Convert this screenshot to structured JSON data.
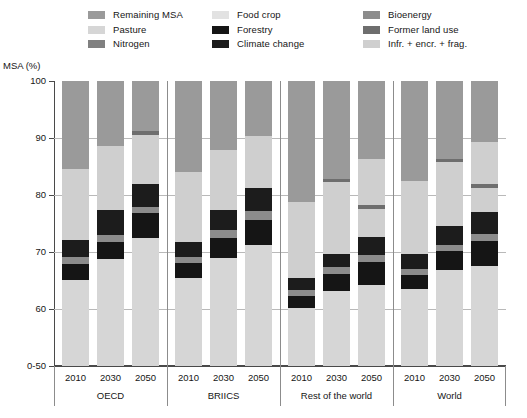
{
  "legend": {
    "columns": [
      [
        {
          "label": "Remaining MSA",
          "key": "remaining_msa",
          "color": "#9a9a9a"
        },
        {
          "label": "Pasture",
          "key": "pasture",
          "color": "#d6d6d6"
        },
        {
          "label": "Nitrogen",
          "key": "nitrogen",
          "color": "#808080"
        }
      ],
      [
        {
          "label": "Food crop",
          "key": "food_crop",
          "color": "#e2e2e2"
        },
        {
          "label": "Forestry",
          "key": "forestry",
          "color": "#151515"
        },
        {
          "label": "Climate change",
          "key": "climate_change",
          "color": "#1c1c1c"
        }
      ],
      [
        {
          "label": "Bioenergy",
          "key": "bioenergy",
          "color": "#8c8c8c"
        },
        {
          "label": "Former land use",
          "key": "former_land_use",
          "color": "#6e6e6e"
        },
        {
          "label": "Infr. + encr. + frag.",
          "key": "infr_encr_frag",
          "color": "#cfcfcf"
        }
      ]
    ]
  },
  "axis": {
    "y_title": "MSA (%)",
    "y_ticks": [
      "100",
      "90",
      "80",
      "70",
      "60",
      "0-50"
    ],
    "y_values": [
      100,
      90,
      80,
      70,
      60,
      50
    ],
    "y_min": 50,
    "y_max": 100
  },
  "chart_data": {
    "type": "bar",
    "title": "",
    "subtitle": "",
    "xlabel": "",
    "ylabel": "MSA (%)",
    "ylim": [
      50,
      100
    ],
    "ytick_labels": [
      "0-50",
      "60",
      "70",
      "80",
      "90",
      "100"
    ],
    "stacked": true,
    "grid": true,
    "legend_position": "top",
    "categories": [
      "OECD",
      "BRIICS",
      "Rest of the world",
      "World"
    ],
    "subcategories": [
      "2010",
      "2030",
      "2050"
    ],
    "series_order": [
      "remaining_msa",
      "former_land_use",
      "infr_encr_frag",
      "nitrogen",
      "climate_change",
      "bioenergy",
      "forestry",
      "food_crop",
      "pasture"
    ],
    "series_colors": {
      "remaining_msa": "#9a9a9a",
      "pasture": "#d6d6d6",
      "nitrogen": "#808080",
      "food_crop": "#e2e2e2",
      "forestry": "#151515",
      "climate_change": "#1c1c1c",
      "bioenergy": "#8c8c8c",
      "former_land_use": "#6e6e6e",
      "infr_encr_frag": "#cfcfcf"
    },
    "groups": [
      {
        "name": "OECD",
        "bars": [
          {
            "year": "2010",
            "segments": [
              {
                "key": "remaining_msa",
                "value": 15.5
              },
              {
                "key": "infr_encr_frag",
                "value": 12.4
              },
              {
                "key": "climate_change",
                "value": 3.0
              },
              {
                "key": "bioenergy",
                "value": 1.2
              },
              {
                "key": "forestry",
                "value": 2.8
              },
              {
                "key": "pasture",
                "value": 15.1
              }
            ]
          },
          {
            "year": "2030",
            "segments": [
              {
                "key": "remaining_msa",
                "value": 11.4
              },
              {
                "key": "infr_encr_frag",
                "value": 11.2
              },
              {
                "key": "climate_change",
                "value": 4.4
              },
              {
                "key": "bioenergy",
                "value": 1.2
              },
              {
                "key": "forestry",
                "value": 3.0
              },
              {
                "key": "pasture",
                "value": 18.8
              }
            ]
          },
          {
            "year": "2050",
            "segments": [
              {
                "key": "remaining_msa",
                "value": 8.8
              },
              {
                "key": "former_land_use",
                "value": 0.7
              },
              {
                "key": "infr_encr_frag",
                "value": 8.6
              },
              {
                "key": "climate_change",
                "value": 4.0
              },
              {
                "key": "bioenergy",
                "value": 1.1
              },
              {
                "key": "forestry",
                "value": 4.4
              },
              {
                "key": "pasture",
                "value": 22.4
              }
            ]
          }
        ]
      },
      {
        "name": "BRIICS",
        "bars": [
          {
            "year": "2010",
            "segments": [
              {
                "key": "remaining_msa",
                "value": 16.0
              },
              {
                "key": "infr_encr_frag",
                "value": 12.2
              },
              {
                "key": "climate_change",
                "value": 2.7
              },
              {
                "key": "bioenergy",
                "value": 1.0
              },
              {
                "key": "forestry",
                "value": 2.6
              },
              {
                "key": "pasture",
                "value": 15.5
              }
            ]
          },
          {
            "year": "2030",
            "segments": [
              {
                "key": "remaining_msa",
                "value": 12.1
              },
              {
                "key": "infr_encr_frag",
                "value": 10.5
              },
              {
                "key": "climate_change",
                "value": 3.6
              },
              {
                "key": "bioenergy",
                "value": 1.3
              },
              {
                "key": "forestry",
                "value": 3.6
              },
              {
                "key": "pasture",
                "value": 18.9
              }
            ]
          },
          {
            "year": "2050",
            "segments": [
              {
                "key": "remaining_msa",
                "value": 9.6
              },
              {
                "key": "infr_encr_frag",
                "value": 9.2
              },
              {
                "key": "climate_change",
                "value": 4.0
              },
              {
                "key": "bioenergy",
                "value": 1.5
              },
              {
                "key": "forestry",
                "value": 4.4
              },
              {
                "key": "pasture",
                "value": 21.3
              }
            ]
          }
        ]
      },
      {
        "name": "Rest of the world",
        "bars": [
          {
            "year": "2010",
            "segments": [
              {
                "key": "remaining_msa",
                "value": 21.2
              },
              {
                "key": "infr_encr_frag",
                "value": 13.3
              },
              {
                "key": "climate_change",
                "value": 2.2
              },
              {
                "key": "bioenergy",
                "value": 1.1
              },
              {
                "key": "forestry",
                "value": 2.0
              },
              {
                "key": "pasture",
                "value": 10.2
              }
            ]
          },
          {
            "year": "2030",
            "segments": [
              {
                "key": "remaining_msa",
                "value": 17.2
              },
              {
                "key": "former_land_use",
                "value": 0.5
              },
              {
                "key": "infr_encr_frag",
                "value": 12.6
              },
              {
                "key": "climate_change",
                "value": 2.4
              },
              {
                "key": "bioenergy",
                "value": 1.1
              },
              {
                "key": "forestry",
                "value": 3.0
              },
              {
                "key": "pasture",
                "value": 13.2
              }
            ]
          },
          {
            "year": "2050",
            "segments": [
              {
                "key": "remaining_msa",
                "value": 13.6
              },
              {
                "key": "infr_encr_frag",
                "value": 8.1
              },
              {
                "key": "former_land_use",
                "value": 0.8
              },
              {
                "key": "infr_encr_frag2",
                "value": 4.8
              },
              {
                "key": "climate_change",
                "value": 3.2
              },
              {
                "key": "bioenergy",
                "value": 1.3
              },
              {
                "key": "forestry",
                "value": 4.0
              },
              {
                "key": "pasture",
                "value": 14.2
              }
            ]
          }
        ]
      },
      {
        "name": "World",
        "bars": [
          {
            "year": "2010",
            "segments": [
              {
                "key": "remaining_msa",
                "value": 17.6
              },
              {
                "key": "infr_encr_frag",
                "value": 12.8
              },
              {
                "key": "climate_change",
                "value": 2.5
              },
              {
                "key": "bioenergy",
                "value": 1.1
              },
              {
                "key": "forestry",
                "value": 2.5
              },
              {
                "key": "pasture",
                "value": 13.5
              }
            ]
          },
          {
            "year": "2030",
            "segments": [
              {
                "key": "remaining_msa",
                "value": 13.6
              },
              {
                "key": "former_land_use",
                "value": 0.6
              },
              {
                "key": "infr_encr_frag",
                "value": 11.2
              },
              {
                "key": "climate_change",
                "value": 3.3
              },
              {
                "key": "bioenergy",
                "value": 1.2
              },
              {
                "key": "forestry",
                "value": 3.3
              },
              {
                "key": "pasture",
                "value": 16.8
              }
            ]
          },
          {
            "year": "2050",
            "segments": [
              {
                "key": "remaining_msa",
                "value": 10.7
              },
              {
                "key": "infr_encr_frag",
                "value": 7.4
              },
              {
                "key": "former_land_use",
                "value": 0.7
              },
              {
                "key": "infr_encr_frag2",
                "value": 4.2
              },
              {
                "key": "climate_change",
                "value": 3.8
              },
              {
                "key": "bioenergy",
                "value": 1.3
              },
              {
                "key": "forestry",
                "value": 4.3
              },
              {
                "key": "pasture",
                "value": 17.6
              }
            ]
          }
        ]
      }
    ]
  }
}
